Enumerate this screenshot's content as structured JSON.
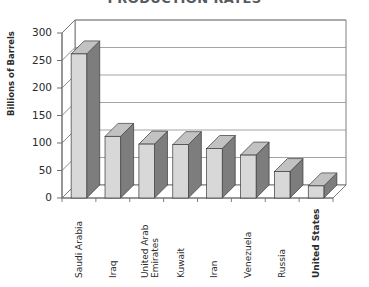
{
  "chart_data": {
    "type": "bar",
    "title": "PRODUCTION RATES",
    "xlabel": "",
    "ylabel": "Billions of Barrels",
    "ylim": [
      0,
      300
    ],
    "yticks": [
      0,
      50,
      100,
      150,
      200,
      250,
      300
    ],
    "grid": true,
    "legend": "none",
    "style": "3d-column",
    "categories": [
      "Saudi Arabia",
      "Iraq",
      "United Arab Emirates",
      "Kuwait",
      "Iran",
      "Venezuela",
      "Russia",
      "United States"
    ],
    "values": [
      262,
      112,
      98,
      97,
      90,
      78,
      48,
      22
    ],
    "series": [
      {
        "name": "Proven Oil Reserves",
        "values": [
          262,
          112,
          98,
          97,
          90,
          78,
          48,
          22
        ]
      }
    ],
    "colors": {
      "bar_front": "#d8d8d8",
      "bar_side": "#7d7d7d",
      "bar_top": "#c2c2c2",
      "bar_outline": "#3a3a3a",
      "axis": "#6f6f6f",
      "gridline": "#8d8d8d",
      "text": "#2b2b2b",
      "title": "#555b5e",
      "background": "#ffffff"
    }
  },
  "axis": {
    "y_tick_labels": [
      "300",
      "250",
      "200",
      "150",
      "100",
      "50",
      "0"
    ]
  },
  "x_labels": [
    {
      "text": "Saudi Arabia",
      "bold": false,
      "two_line": false
    },
    {
      "text": "Iraq",
      "bold": false,
      "two_line": false
    },
    {
      "text": "United Arab Emirates",
      "bold": false,
      "two_line": true
    },
    {
      "text": "Kuwait",
      "bold": false,
      "two_line": false
    },
    {
      "text": "Iran",
      "bold": false,
      "two_line": false
    },
    {
      "text": "Venezuela",
      "bold": false,
      "two_line": false
    },
    {
      "text": "Russia",
      "bold": false,
      "two_line": false
    },
    {
      "text": "United States",
      "bold": true,
      "two_line": false
    }
  ]
}
